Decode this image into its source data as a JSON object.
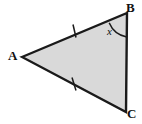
{
  "figure": {
    "type": "geometry-diagram",
    "shape": "triangle",
    "fill_color": "#d9d9d9",
    "stroke_color": "#1a1a1a",
    "background_color": "#ffffff",
    "stroke_width": 2.4,
    "vertices": [
      {
        "name": "A",
        "label": "A",
        "x": 22,
        "y": 57
      },
      {
        "name": "B",
        "label": "B",
        "x": 127,
        "y": 13
      },
      {
        "name": "C",
        "label": "C",
        "x": 126,
        "y": 112
      }
    ],
    "sides": [
      {
        "name": "AB",
        "from": "A",
        "to": "B",
        "tick_marks": 1
      },
      {
        "name": "BC",
        "from": "B",
        "to": "C",
        "tick_marks": 0
      },
      {
        "name": "AC",
        "from": "A",
        "to": "C",
        "tick_marks": 1
      }
    ],
    "tick_marks": [
      {
        "side": "AB",
        "x": 74,
        "y": 31,
        "count": 1
      },
      {
        "side": "AC",
        "x": 74,
        "y": 84,
        "count": 1
      }
    ],
    "angles": [
      {
        "vertex": "B",
        "label": "x",
        "arc_radius": 22,
        "label_x": 110,
        "label_y": 31
      }
    ]
  }
}
